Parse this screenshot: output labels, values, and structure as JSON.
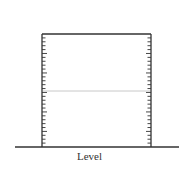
{
  "diagram": {
    "type": "graduated-container",
    "label": "Level",
    "container": {
      "left": 42,
      "right": 151,
      "top": 34,
      "bottom": 147
    },
    "ground_line": {
      "x1": 15,
      "x2": 179,
      "y": 147
    },
    "level_line": {
      "y": 91,
      "color": "#c8c8c8"
    },
    "tick_count": 28,
    "colors": {
      "stroke": "#333333",
      "level": "#c8c8c8"
    }
  }
}
